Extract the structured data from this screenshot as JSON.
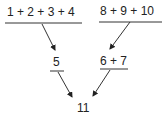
{
  "diagram": {
    "left_top": "1 + 2 + 3 + 4",
    "right_top": "8 + 9 + 10",
    "left_mid": "5",
    "right_mid": "6 + 7",
    "result": "11"
  },
  "colors": {
    "ink": "#222222",
    "background": "#ffffff"
  }
}
